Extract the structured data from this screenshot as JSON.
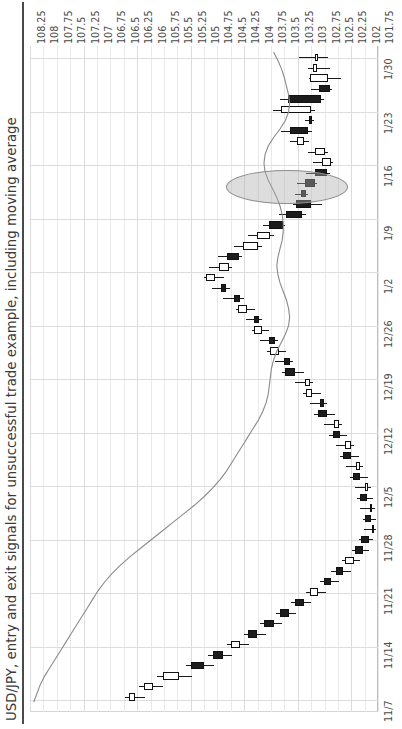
{
  "chart_title": "USD/JPY, entry and exit signals for unsuccessful trade example, including moving average",
  "axes": {
    "price_labels": [
      "108.25",
      "108",
      "107.75",
      "107.5",
      "107.25",
      "107",
      "106.75",
      "106.5",
      "106.25",
      "106",
      "105.75",
      "105.5",
      "105.25",
      "105",
      "104.75",
      "104.5",
      "104.25",
      "104",
      "103.75",
      "103.5",
      "103.25",
      "103",
      "102.75",
      "102.5",
      "102.25",
      "102",
      "101.75"
    ],
    "date_labels": [
      "1/30",
      "1/23",
      "1/16",
      "1/9",
      "1/2",
      "12/26",
      "12/19",
      "12/12",
      "12/5",
      "11/28",
      "11/21",
      "11/14",
      "11/7"
    ]
  },
  "annotation": {
    "name": "signal-ellipse-highlight"
  },
  "colors": {
    "candle_down": "#1c1c1c",
    "candle_up": "#ffffff",
    "candle_outline": "#111111",
    "moving_average": "#8a8a8a",
    "grid": "#e4e4e4",
    "ellipse_fill": "#afafaf",
    "text": "#3a3a3a"
  },
  "chart_data": {
    "type": "candlestick",
    "title": "USD/JPY, entry and exit signals for unsuccessful trade example, including moving average",
    "xlabel": "",
    "ylabel": "",
    "orientation": "rotated-90ccw",
    "price_axis": {
      "min": 101.75,
      "max": 108.25,
      "step": 0.25,
      "direction": "high-to-low-left-to-right"
    },
    "date_axis": {
      "start": "1/30",
      "end": "11/7",
      "direction": "newest-top-to-oldest-bottom",
      "tick_interval_days": 7
    },
    "grid": true,
    "legend": "none",
    "series_name": "USD/JPY",
    "moving_average": {
      "name": "moving average",
      "color": "#8a8a8a",
      "values": [
        103.7,
        103.62,
        103.55,
        103.5,
        103.46,
        103.42,
        103.4,
        103.42,
        103.48,
        103.58,
        103.7,
        103.8,
        103.86,
        103.88,
        103.86,
        103.8,
        103.72,
        103.64,
        103.58,
        103.54,
        103.52,
        103.52,
        103.54,
        103.58,
        103.62,
        103.64,
        103.62,
        103.58,
        103.52,
        103.46,
        103.42,
        103.4,
        103.42,
        103.48,
        103.56,
        103.64,
        103.7,
        103.74,
        103.76,
        103.78,
        103.8,
        103.84,
        103.9,
        103.98,
        104.08,
        104.18,
        104.28,
        104.38,
        104.48,
        104.58,
        104.7,
        104.84,
        105.0,
        105.18,
        105.38,
        105.58,
        105.78,
        105.98,
        106.18,
        106.38,
        106.56,
        106.72,
        106.86,
        106.98,
        107.08,
        107.18,
        107.28,
        107.38,
        107.48,
        107.58,
        107.68,
        107.78,
        107.88,
        107.98,
        108.06,
        108.12,
        108.18
      ]
    },
    "candles": [
      {
        "date": "1/30",
        "open": 102.92,
        "high": 103.22,
        "low": 102.68,
        "close": 102.92,
        "dir": "doji"
      },
      {
        "date": "1/29",
        "open": 102.88,
        "high": 103.06,
        "low": 102.64,
        "close": 102.96,
        "dir": "up"
      },
      {
        "date": "1/28",
        "open": 102.68,
        "high": 103.04,
        "low": 102.44,
        "close": 103.02,
        "dir": "up"
      },
      {
        "date": "1/27",
        "open": 102.86,
        "high": 103.0,
        "low": 102.6,
        "close": 102.64,
        "dir": "down"
      },
      {
        "date": "1/24",
        "open": 103.44,
        "high": 103.58,
        "low": 102.76,
        "close": 102.82,
        "dir": "down"
      },
      {
        "date": "1/23",
        "open": 103.56,
        "high": 103.72,
        "low": 102.92,
        "close": 103.0,
        "dir": "up"
      },
      {
        "date": "1/22",
        "open": 103.04,
        "high": 103.12,
        "low": 102.94,
        "close": 102.98,
        "dir": "down"
      },
      {
        "date": "1/21",
        "open": 103.4,
        "high": 103.56,
        "low": 102.98,
        "close": 103.06,
        "dir": "down"
      },
      {
        "date": "1/20",
        "open": 103.26,
        "high": 103.4,
        "low": 103.04,
        "close": 103.14,
        "dir": "up"
      },
      {
        "date": "1/17",
        "open": 102.92,
        "high": 103.06,
        "low": 102.68,
        "close": 102.74,
        "dir": "up"
      },
      {
        "date": "1/16",
        "open": 102.8,
        "high": 102.96,
        "low": 102.58,
        "close": 102.62,
        "dir": "up"
      },
      {
        "date": "1/15",
        "open": 102.92,
        "high": 103.1,
        "low": 102.64,
        "close": 102.7,
        "dir": "down"
      },
      {
        "date": "1/14",
        "open": 103.12,
        "high": 103.26,
        "low": 102.88,
        "close": 102.92,
        "dir": "down"
      },
      {
        "date": "1/13",
        "open": 103.18,
        "high": 103.3,
        "low": 103.06,
        "close": 103.1,
        "dir": "down"
      },
      {
        "date": "1/10",
        "open": 103.0,
        "high": 103.34,
        "low": 102.8,
        "close": 103.28,
        "dir": "down"
      },
      {
        "date": "1/9",
        "open": 103.46,
        "high": 103.6,
        "low": 103.1,
        "close": 103.16,
        "dir": "down"
      },
      {
        "date": "1/8",
        "open": 103.78,
        "high": 103.9,
        "low": 103.48,
        "close": 103.52,
        "dir": "down"
      },
      {
        "date": "1/7",
        "open": 104.02,
        "high": 104.18,
        "low": 103.7,
        "close": 103.76,
        "dir": "up"
      },
      {
        "date": "1/6",
        "open": 104.28,
        "high": 104.44,
        "low": 103.92,
        "close": 104.0,
        "dir": "up"
      },
      {
        "date": "1/3",
        "open": 104.58,
        "high": 104.74,
        "low": 104.28,
        "close": 104.34,
        "dir": "down"
      },
      {
        "date": "1/2",
        "open": 104.72,
        "high": 104.9,
        "low": 104.48,
        "close": 104.54,
        "dir": "up"
      },
      {
        "date": "12/31",
        "open": 104.8,
        "high": 105.0,
        "low": 104.62,
        "close": 104.96,
        "dir": "up"
      },
      {
        "date": "12/30",
        "open": 104.68,
        "high": 104.86,
        "low": 104.52,
        "close": 104.58,
        "dir": "down"
      },
      {
        "date": "12/27",
        "open": 104.44,
        "high": 104.64,
        "low": 104.26,
        "close": 104.32,
        "dir": "down"
      },
      {
        "date": "12/26",
        "open": 104.2,
        "high": 104.4,
        "low": 104.04,
        "close": 104.36,
        "dir": "up"
      },
      {
        "date": "12/25",
        "open": 104.06,
        "high": 104.22,
        "low": 103.92,
        "close": 103.98,
        "dir": "down"
      },
      {
        "date": "12/24",
        "open": 103.92,
        "high": 104.1,
        "low": 103.78,
        "close": 104.06,
        "dir": "up"
      },
      {
        "date": "12/23",
        "open": 103.78,
        "high": 103.96,
        "low": 103.62,
        "close": 103.68,
        "dir": "down"
      },
      {
        "date": "12/20",
        "open": 103.6,
        "high": 103.82,
        "low": 103.46,
        "close": 103.76,
        "dir": "up"
      },
      {
        "date": "12/19",
        "open": 103.5,
        "high": 103.68,
        "low": 103.34,
        "close": 103.4,
        "dir": "down"
      },
      {
        "date": "12/18",
        "open": 103.3,
        "high": 103.54,
        "low": 103.14,
        "close": 103.48,
        "dir": "down"
      },
      {
        "date": "12/17",
        "open": 103.12,
        "high": 103.3,
        "low": 102.96,
        "close": 103.02,
        "dir": "up"
      },
      {
        "date": "12/16",
        "open": 102.98,
        "high": 103.16,
        "low": 102.82,
        "close": 103.1,
        "dir": "up"
      },
      {
        "date": "12/13",
        "open": 102.84,
        "high": 103.02,
        "low": 102.7,
        "close": 102.76,
        "dir": "down"
      },
      {
        "date": "12/12",
        "open": 102.7,
        "high": 102.94,
        "low": 102.56,
        "close": 102.88,
        "dir": "down"
      },
      {
        "date": "12/11",
        "open": 102.58,
        "high": 102.76,
        "low": 102.42,
        "close": 102.48,
        "dir": "up"
      },
      {
        "date": "12/10",
        "open": 102.46,
        "high": 102.66,
        "low": 102.32,
        "close": 102.6,
        "dir": "down"
      },
      {
        "date": "12/9",
        "open": 102.36,
        "high": 102.54,
        "low": 102.2,
        "close": 102.26,
        "dir": "up"
      },
      {
        "date": "12/6",
        "open": 102.26,
        "high": 102.46,
        "low": 102.1,
        "close": 102.4,
        "dir": "down"
      },
      {
        "date": "12/5",
        "open": 102.16,
        "high": 102.34,
        "low": 102.02,
        "close": 102.08,
        "dir": "up"
      },
      {
        "date": "12/4",
        "open": 102.08,
        "high": 102.28,
        "low": 101.94,
        "close": 102.22,
        "dir": "down"
      },
      {
        "date": "12/3",
        "open": 102.0,
        "high": 102.18,
        "low": 101.88,
        "close": 101.94,
        "dir": "up"
      },
      {
        "date": "12/2",
        "open": 101.96,
        "high": 102.14,
        "low": 101.84,
        "close": 102.08,
        "dir": "down"
      },
      {
        "date": "11/29",
        "open": 101.9,
        "high": 102.08,
        "low": 101.8,
        "close": 101.86,
        "dir": "up"
      },
      {
        "date": "11/28",
        "open": 101.88,
        "high": 102.04,
        "low": 101.78,
        "close": 102.0,
        "dir": "down"
      },
      {
        "date": "11/27",
        "open": 101.86,
        "high": 102.02,
        "low": 101.78,
        "close": 101.82,
        "dir": "up"
      },
      {
        "date": "11/26",
        "open": 101.92,
        "high": 102.1,
        "low": 101.84,
        "close": 102.06,
        "dir": "down"
      },
      {
        "date": "11/25",
        "open": 102.04,
        "high": 102.24,
        "low": 101.92,
        "close": 102.18,
        "dir": "down"
      },
      {
        "date": "11/22",
        "open": 102.2,
        "high": 102.42,
        "low": 102.08,
        "close": 102.36,
        "dir": "up"
      },
      {
        "date": "11/21",
        "open": 102.4,
        "high": 102.62,
        "low": 102.26,
        "close": 102.54,
        "dir": "down"
      },
      {
        "date": "11/20",
        "open": 102.62,
        "high": 102.84,
        "low": 102.48,
        "close": 102.76,
        "dir": "down"
      },
      {
        "date": "11/19",
        "open": 102.88,
        "high": 103.1,
        "low": 102.72,
        "close": 103.02,
        "dir": "up"
      },
      {
        "date": "11/18",
        "open": 103.14,
        "high": 103.38,
        "low": 103.0,
        "close": 103.3,
        "dir": "down"
      },
      {
        "date": "11/15",
        "open": 103.42,
        "high": 103.66,
        "low": 103.28,
        "close": 103.58,
        "dir": "down"
      },
      {
        "date": "11/14",
        "open": 103.7,
        "high": 103.96,
        "low": 103.54,
        "close": 103.88,
        "dir": "down"
      },
      {
        "date": "11/13",
        "open": 104.0,
        "high": 104.26,
        "low": 103.84,
        "close": 104.18,
        "dir": "down"
      },
      {
        "date": "11/12",
        "open": 104.32,
        "high": 104.58,
        "low": 104.16,
        "close": 104.5,
        "dir": "up"
      },
      {
        "date": "11/11",
        "open": 104.64,
        "high": 104.92,
        "low": 104.48,
        "close": 104.84,
        "dir": "down"
      },
      {
        "date": "11/8",
        "open": 105.0,
        "high": 105.34,
        "low": 104.82,
        "close": 105.24,
        "dir": "down"
      },
      {
        "date": "11/7",
        "open": 105.46,
        "high": 105.88,
        "low": 105.22,
        "close": 105.76,
        "dir": "up"
      },
      {
        "date": "11/6",
        "open": 105.96,
        "high": 106.22,
        "low": 105.76,
        "close": 106.12,
        "dir": "up"
      },
      {
        "date": "11/5",
        "open": 106.28,
        "high": 106.48,
        "low": 106.1,
        "close": 106.4,
        "dir": "up"
      }
    ]
  }
}
